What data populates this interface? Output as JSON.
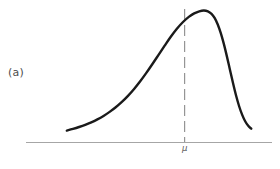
{
  "figure": {
    "panel_label": "(a)",
    "mean_label": "μ",
    "background_color": "#ffffff",
    "curve_color": "#1a1a1a",
    "axis_color": "#a6a6a6",
    "mean_line_color": "#8c8c8c",
    "label_color": "#4d4d4d"
  },
  "chart_data": {
    "type": "line",
    "title": "",
    "subtitle": "",
    "xlabel": "",
    "ylabel": "",
    "annotations": [
      {
        "name": "panel-label",
        "text": "(a)",
        "x": 0.04,
        "y": 0.57
      },
      {
        "name": "mean-tick-label",
        "text": "μ",
        "x": 0.67,
        "y": -0.06
      }
    ],
    "legend": [],
    "legend_position": "none",
    "grid": false,
    "xlim": [
      0,
      1
    ],
    "ylim": [
      0,
      1
    ],
    "series": [
      {
        "name": "density",
        "style": "solid",
        "color": "#1a1a1a",
        "x": [
          0.09,
          0.12,
          0.15,
          0.18,
          0.21,
          0.24,
          0.27,
          0.3,
          0.33,
          0.36,
          0.39,
          0.42,
          0.45,
          0.48,
          0.51,
          0.54,
          0.57,
          0.6,
          0.63,
          0.66,
          0.69,
          0.715,
          0.74,
          0.762,
          0.782,
          0.8,
          0.815,
          0.83,
          0.845,
          0.86,
          0.875,
          0.89,
          0.905,
          0.92,
          0.935,
          0.95,
          0.965,
          0.98,
          0.995
        ],
        "y": [
          0.045,
          0.058,
          0.073,
          0.09,
          0.11,
          0.133,
          0.16,
          0.192,
          0.228,
          0.27,
          0.318,
          0.372,
          0.432,
          0.498,
          0.568,
          0.64,
          0.712,
          0.782,
          0.845,
          0.898,
          0.94,
          0.966,
          0.982,
          0.988,
          0.982,
          0.962,
          0.93,
          0.88,
          0.812,
          0.728,
          0.63,
          0.525,
          0.42,
          0.322,
          0.238,
          0.17,
          0.118,
          0.082,
          0.06
        ]
      },
      {
        "name": "mean-line",
        "style": "dashdot",
        "color": "#8c8c8c",
        "x": [
          0.668,
          0.668
        ],
        "y": [
          0.0,
          1.0
        ]
      }
    ],
    "axis": {
      "name": "baseline",
      "style": "solid",
      "color": "#a6a6a6",
      "x": [
        0.0,
        1.0
      ],
      "y": [
        0.0,
        0.0
      ]
    },
    "markers": [
      {
        "name": "mean",
        "x": 0.668,
        "label": "μ"
      }
    ]
  }
}
